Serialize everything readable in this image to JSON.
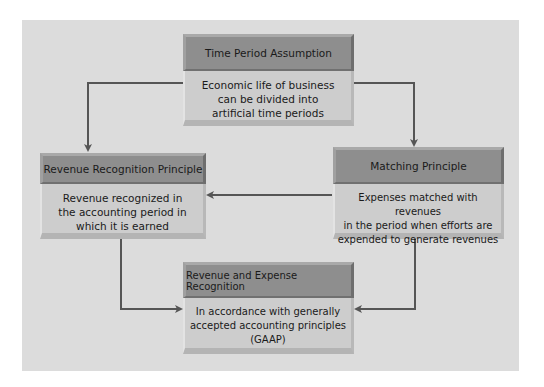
{
  "diagram": {
    "background_color": "#dcdcdc",
    "header_color": "#8e8e8e",
    "body_color": "#cdcdcd",
    "arrow_color": "#555555",
    "nodes": [
      {
        "id": "time_period",
        "title": "Time Period Assumption",
        "lines": [
          "Economic life of business",
          "can be divided into",
          "artificial time periods"
        ]
      },
      {
        "id": "revenue_recognition",
        "title": "Revenue Recognition Principle",
        "lines": [
          "Revenue recognized in",
          "the accounting period in",
          "which it is earned"
        ]
      },
      {
        "id": "matching",
        "title": "Matching Principle",
        "lines": [
          "Expenses matched with revenues",
          "in the period when efforts are",
          "expended to generate revenues"
        ]
      },
      {
        "id": "rev_exp_recognition",
        "title": "Revenue and Expense Recognition",
        "lines": [
          "In accordance with generally",
          "accepted accounting principles",
          "(GAAP)"
        ]
      }
    ],
    "edges": [
      {
        "from": "time_period",
        "to": "revenue_recognition"
      },
      {
        "from": "time_period",
        "to": "matching"
      },
      {
        "from": "matching",
        "to": "revenue_recognition"
      },
      {
        "from": "revenue_recognition",
        "to": "rev_exp_recognition"
      },
      {
        "from": "matching",
        "to": "rev_exp_recognition"
      }
    ]
  }
}
